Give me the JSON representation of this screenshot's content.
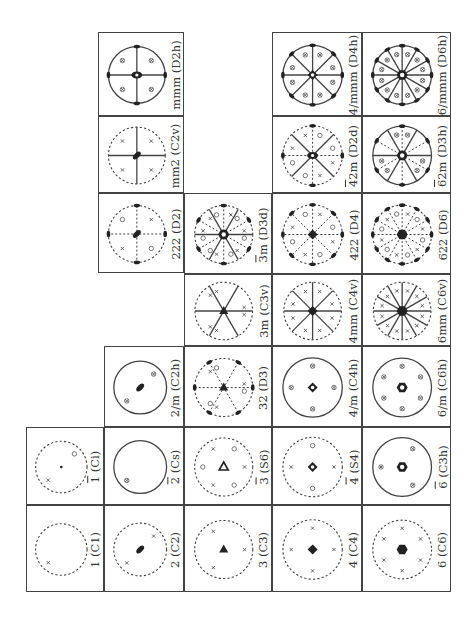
{
  "figure": {
    "orientation": "rotated 90° counter-clockwise",
    "line_color": "#444444"
  },
  "cells": [
    {
      "id": "C1",
      "label": "1 (C1)",
      "bar": "",
      "x": 26,
      "y": 505,
      "w": 78,
      "h": 87,
      "circle": "dashed",
      "sym": "none"
    },
    {
      "id": "Ci",
      "label": "1 (Ci)",
      "bar": "1",
      "x": 26,
      "y": 427,
      "w": 78,
      "h": 78,
      "circle": "dashed",
      "sym": "dot"
    },
    {
      "id": "C2",
      "label": "2 (C2)",
      "bar": "",
      "x": 104,
      "y": 505,
      "w": 80,
      "h": 87,
      "circle": "dashed",
      "sym": "ellipse"
    },
    {
      "id": "Cs",
      "label": "2 (Cs)",
      "bar": "2",
      "x": 104,
      "y": 427,
      "w": 80,
      "h": 78,
      "circle": "solid",
      "sym": "none"
    },
    {
      "id": "C2h",
      "label": "2/m (C2h)",
      "bar": "",
      "x": 104,
      "y": 346,
      "w": 80,
      "h": 81,
      "circle": "solid",
      "sym": "ellipse"
    },
    {
      "id": "C3",
      "label": "3 (C3)",
      "bar": "",
      "x": 184,
      "y": 505,
      "w": 88,
      "h": 87,
      "circle": "dashed",
      "sym": "triangle"
    },
    {
      "id": "S6",
      "label": "3 (S6)",
      "bar": "3",
      "x": 184,
      "y": 427,
      "w": 88,
      "h": 78,
      "circle": "dashed",
      "sym": "triangle-open"
    },
    {
      "id": "D3",
      "label": "32 (D3)",
      "bar": "",
      "x": 184,
      "y": 346,
      "w": 88,
      "h": 81,
      "circle": "dashed",
      "sym": "triangle"
    },
    {
      "id": "C3v",
      "label": "3m (C3v)",
      "bar": "",
      "x": 184,
      "y": 274,
      "w": 88,
      "h": 72,
      "circle": "dashed",
      "sym": "triangle"
    },
    {
      "id": "D3d",
      "label": "3m (D3d)",
      "bar": "3",
      "x": 184,
      "y": 193,
      "w": 88,
      "h": 81,
      "circle": "dashed",
      "sym": "hex-open"
    },
    {
      "id": "C4",
      "label": "4 (C4)",
      "bar": "",
      "x": 272,
      "y": 505,
      "w": 90,
      "h": 87,
      "circle": "dashed",
      "sym": "square"
    },
    {
      "id": "S4",
      "label": "4 (S4)",
      "bar": "4",
      "x": 272,
      "y": 427,
      "w": 90,
      "h": 78,
      "circle": "dashed",
      "sym": "square-open"
    },
    {
      "id": "C4h",
      "label": "4/m (C4h)",
      "bar": "",
      "x": 272,
      "y": 346,
      "w": 90,
      "h": 81,
      "circle": "solid",
      "sym": "square-open"
    },
    {
      "id": "C4v",
      "label": "4mm (C4v)",
      "bar": "",
      "x": 272,
      "y": 274,
      "w": 90,
      "h": 72,
      "circle": "dashed",
      "sym": "square"
    },
    {
      "id": "D4",
      "label": "422 (D4)",
      "bar": "",
      "x": 272,
      "y": 193,
      "w": 90,
      "h": 81,
      "circle": "dashed",
      "sym": "square"
    },
    {
      "id": "D2d",
      "label": "42m (D2d)",
      "bar": "4",
      "x": 272,
      "y": 116,
      "w": 90,
      "h": 77,
      "circle": "dashed",
      "sym": "ellipse-open"
    },
    {
      "id": "D4h",
      "label": "4/mmm (D4h)",
      "bar": "",
      "x": 272,
      "y": 32,
      "w": 90,
      "h": 84,
      "circle": "solid",
      "sym": "square-open"
    },
    {
      "id": "C6",
      "label": "6 (C6)",
      "bar": "",
      "x": 362,
      "y": 505,
      "w": 89,
      "h": 87,
      "circle": "dashed",
      "sym": "hexagon"
    },
    {
      "id": "C3h",
      "label": "6 (C3h)",
      "bar": "6",
      "x": 362,
      "y": 427,
      "w": 89,
      "h": 78,
      "circle": "solid",
      "sym": "hex-open"
    },
    {
      "id": "C6h",
      "label": "6/m (C6h)",
      "bar": "",
      "x": 362,
      "y": 346,
      "w": 89,
      "h": 81,
      "circle": "solid",
      "sym": "hex-open"
    },
    {
      "id": "C6v",
      "label": "6mm (C6v)",
      "bar": "",
      "x": 362,
      "y": 274,
      "w": 89,
      "h": 72,
      "circle": "dashed",
      "sym": "hexagon"
    },
    {
      "id": "D6",
      "label": "622 (D6)",
      "bar": "",
      "x": 362,
      "y": 193,
      "w": 89,
      "h": 81,
      "circle": "dashed",
      "sym": "hexagon"
    },
    {
      "id": "D3h",
      "label": "62m (D3h)",
      "bar": "6",
      "x": 362,
      "y": 116,
      "w": 89,
      "h": 77,
      "circle": "solid",
      "sym": "hex-open"
    },
    {
      "id": "D6h",
      "label": "6/mmm (D6h)",
      "bar": "",
      "x": 362,
      "y": 32,
      "w": 89,
      "h": 84,
      "circle": "solid",
      "sym": "hex-open"
    },
    {
      "id": "D2",
      "label": "222 (D2)",
      "bar": "",
      "x": 98,
      "y": 193,
      "w": 86,
      "h": 80,
      "circle": "dashed",
      "sym": "ellipse"
    },
    {
      "id": "C2v",
      "label": "mm2 (C2v)",
      "bar": "",
      "x": 98,
      "y": 116,
      "w": 86,
      "h": 77,
      "circle": "dashed",
      "sym": "ellipse"
    },
    {
      "id": "D2h",
      "label": "mmm (D2h)",
      "bar": "",
      "x": 98,
      "y": 32,
      "w": 86,
      "h": 84,
      "circle": "solid",
      "sym": "ellipse-open"
    }
  ],
  "mirrors": {
    "C2h": [],
    "C2v": [
      0,
      90
    ],
    "D2h": [
      0,
      90
    ],
    "C3v": [
      90,
      30,
      150
    ],
    "D3d": [
      90,
      30,
      150
    ],
    "C4v": [
      0,
      45,
      90,
      135
    ],
    "D2d": [
      45,
      135
    ],
    "D4h": [
      0,
      45,
      90,
      135
    ],
    "C6v": [
      0,
      30,
      60,
      90,
      120,
      150
    ],
    "D3h": [
      90,
      30,
      150
    ],
    "D6h": [
      0,
      30,
      60,
      90,
      120,
      150
    ]
  },
  "axes2": {
    "D2": [
      0,
      90
    ],
    "D3": [
      90,
      210,
      330
    ],
    "D3d": [
      0,
      60,
      120
    ],
    "D4": [
      0,
      45,
      90,
      135
    ],
    "D2d": [
      0,
      90
    ],
    "D6": [
      0,
      30,
      60,
      90,
      120,
      150
    ],
    "D4h": [
      0,
      45,
      90,
      135
    ],
    "D6h": [
      0,
      30,
      60,
      90,
      120,
      150
    ],
    "D3h": [
      0,
      60,
      120
    ],
    "D2h": [
      0,
      90
    ]
  },
  "poles": {
    "C1": [
      [
        225,
        "x"
      ]
    ],
    "Ci": [
      [
        225,
        "x"
      ],
      [
        45,
        "o"
      ]
    ],
    "C2": [
      [
        225,
        "x"
      ],
      [
        45,
        "x"
      ]
    ],
    "Cs": [
      [
        225,
        "xo"
      ]
    ],
    "C2h": [
      [
        225,
        "xo"
      ],
      [
        45,
        "xo"
      ]
    ],
    "C3": [
      [
        90,
        "x"
      ],
      [
        210,
        "x"
      ],
      [
        330,
        "x"
      ]
    ],
    "S6": [
      [
        90,
        "x"
      ],
      [
        210,
        "x"
      ],
      [
        330,
        "x"
      ],
      [
        30,
        "o"
      ],
      [
        150,
        "o"
      ],
      [
        270,
        "o"
      ]
    ],
    "D3": [
      [
        80,
        "x"
      ],
      [
        200,
        "x"
      ],
      [
        320,
        "x"
      ],
      [
        100,
        "o"
      ],
      [
        220,
        "o"
      ],
      [
        340,
        "o"
      ]
    ],
    "C3v": [
      [
        80,
        "x"
      ],
      [
        100,
        "x"
      ],
      [
        200,
        "x"
      ],
      [
        220,
        "x"
      ],
      [
        320,
        "x"
      ],
      [
        340,
        "x"
      ]
    ],
    "D3d": [
      [
        80,
        "x"
      ],
      [
        100,
        "o"
      ],
      [
        200,
        "x"
      ],
      [
        220,
        "o"
      ],
      [
        320,
        "x"
      ],
      [
        340,
        "o"
      ],
      [
        40,
        "o"
      ],
      [
        20,
        "x"
      ],
      [
        160,
        "o"
      ],
      [
        140,
        "x"
      ],
      [
        260,
        "o"
      ],
      [
        280,
        "x"
      ]
    ],
    "C4": [
      [
        0,
        "x"
      ],
      [
        90,
        "x"
      ],
      [
        180,
        "x"
      ],
      [
        270,
        "x"
      ]
    ],
    "S4": [
      [
        0,
        "o"
      ],
      [
        90,
        "x"
      ],
      [
        180,
        "o"
      ],
      [
        270,
        "x"
      ]
    ],
    "C4h": [
      [
        0,
        "xo"
      ],
      [
        90,
        "xo"
      ],
      [
        180,
        "xo"
      ],
      [
        270,
        "xo"
      ]
    ],
    "C4v": [
      [
        20,
        "x"
      ],
      [
        70,
        "x"
      ],
      [
        110,
        "x"
      ],
      [
        160,
        "x"
      ],
      [
        200,
        "x"
      ],
      [
        250,
        "x"
      ],
      [
        290,
        "x"
      ],
      [
        340,
        "x"
      ]
    ],
    "D4": [
      [
        20,
        "x"
      ],
      [
        70,
        "o"
      ],
      [
        110,
        "x"
      ],
      [
        160,
        "o"
      ],
      [
        200,
        "x"
      ],
      [
        250,
        "o"
      ],
      [
        290,
        "x"
      ],
      [
        340,
        "o"
      ]
    ],
    "D2d": [
      [
        70,
        "o"
      ],
      [
        110,
        "x"
      ],
      [
        160,
        "x"
      ],
      [
        200,
        "o"
      ],
      [
        250,
        "o"
      ],
      [
        290,
        "x"
      ],
      [
        340,
        "x"
      ],
      [
        20,
        "o"
      ]
    ],
    "D4h": [
      [
        20,
        "xo"
      ],
      [
        70,
        "xo"
      ],
      [
        110,
        "xo"
      ],
      [
        160,
        "xo"
      ],
      [
        200,
        "xo"
      ],
      [
        250,
        "xo"
      ],
      [
        290,
        "xo"
      ],
      [
        340,
        "xo"
      ]
    ],
    "C6": [
      [
        0,
        "x"
      ],
      [
        60,
        "x"
      ],
      [
        120,
        "x"
      ],
      [
        180,
        "x"
      ],
      [
        240,
        "x"
      ],
      [
        300,
        "x"
      ]
    ],
    "C3h": [
      [
        30,
        "xo"
      ],
      [
        150,
        "xo"
      ],
      [
        270,
        "xo"
      ]
    ],
    "C6h": [
      [
        0,
        "xo"
      ],
      [
        60,
        "xo"
      ],
      [
        120,
        "xo"
      ],
      [
        180,
        "xo"
      ],
      [
        240,
        "xo"
      ],
      [
        300,
        "xo"
      ]
    ],
    "C6v": [
      [
        15,
        "x"
      ],
      [
        45,
        "x"
      ],
      [
        75,
        "x"
      ],
      [
        105,
        "x"
      ],
      [
        135,
        "x"
      ],
      [
        165,
        "x"
      ],
      [
        195,
        "x"
      ],
      [
        225,
        "x"
      ],
      [
        255,
        "x"
      ],
      [
        285,
        "x"
      ],
      [
        315,
        "x"
      ],
      [
        345,
        "x"
      ]
    ],
    "D6": [
      [
        15,
        "x"
      ],
      [
        45,
        "o"
      ],
      [
        75,
        "x"
      ],
      [
        105,
        "o"
      ],
      [
        135,
        "x"
      ],
      [
        165,
        "o"
      ],
      [
        195,
        "x"
      ],
      [
        225,
        "o"
      ],
      [
        255,
        "x"
      ],
      [
        285,
        "o"
      ],
      [
        315,
        "x"
      ],
      [
        345,
        "o"
      ]
    ],
    "D3h": [
      [
        15,
        "xo"
      ],
      [
        105,
        "xo"
      ],
      [
        135,
        "xo"
      ],
      [
        225,
        "xo"
      ],
      [
        255,
        "xo"
      ],
      [
        345,
        "xo"
      ]
    ],
    "D6h": [
      [
        15,
        "xo"
      ],
      [
        45,
        "xo"
      ],
      [
        75,
        "xo"
      ],
      [
        105,
        "xo"
      ],
      [
        135,
        "xo"
      ],
      [
        165,
        "xo"
      ],
      [
        195,
        "xo"
      ],
      [
        225,
        "xo"
      ],
      [
        255,
        "xo"
      ],
      [
        285,
        "xo"
      ],
      [
        315,
        "xo"
      ],
      [
        345,
        "xo"
      ]
    ],
    "D2": [
      [
        45,
        "x"
      ],
      [
        135,
        "o"
      ],
      [
        225,
        "x"
      ],
      [
        315,
        "o"
      ]
    ],
    "C2v": [
      [
        45,
        "x"
      ],
      [
        135,
        "x"
      ],
      [
        225,
        "x"
      ],
      [
        315,
        "x"
      ]
    ],
    "D2h": [
      [
        45,
        "xo"
      ],
      [
        135,
        "xo"
      ],
      [
        225,
        "xo"
      ],
      [
        315,
        "xo"
      ]
    ]
  }
}
